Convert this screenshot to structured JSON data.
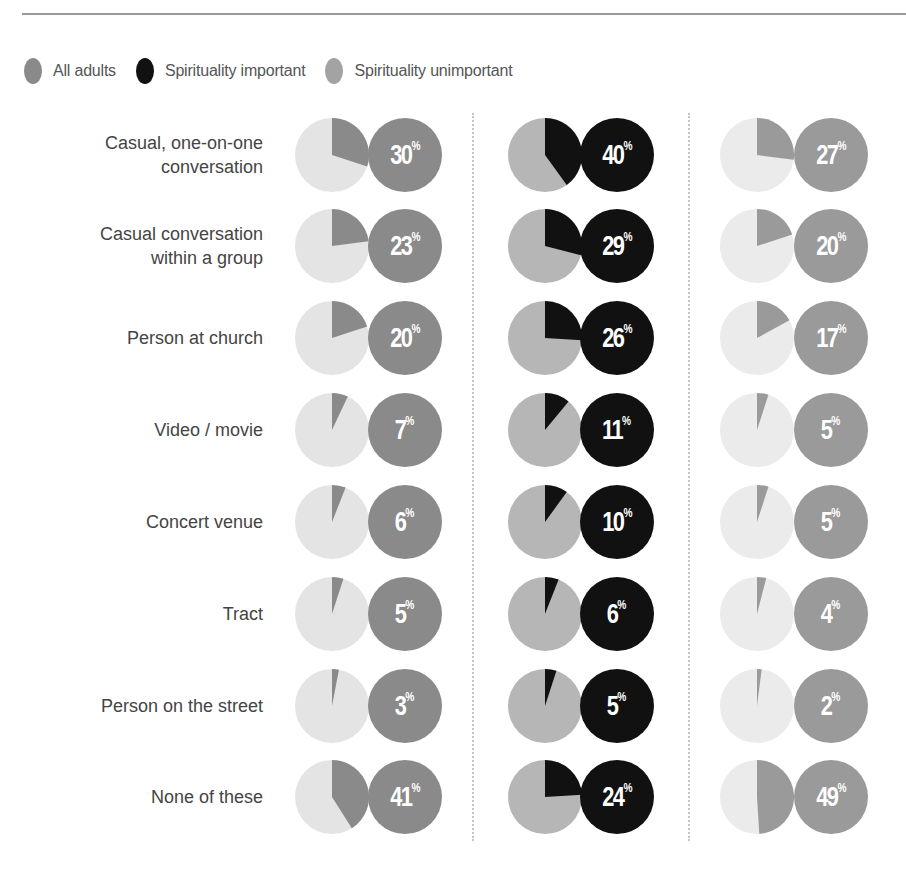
{
  "legend": [
    {
      "label": "All adults",
      "color": "#8a8a8a"
    },
    {
      "label": "Spirituality important",
      "color": "#111111"
    },
    {
      "label": "Spirituality unimportant",
      "color": "#a3a3a3"
    }
  ],
  "series_styles": [
    {
      "name": "All adults",
      "slice": "#8a8a8a",
      "rest": "#e4e4e4",
      "badge": "#8a8a8a"
    },
    {
      "name": "Spirituality important",
      "slice": "#111111",
      "rest": "#b6b6b6",
      "badge": "#111111"
    },
    {
      "name": "Spirituality unimportant",
      "slice": "#9a9a9a",
      "rest": "#ebebeb",
      "badge": "#9a9a9a"
    }
  ],
  "rows": [
    {
      "label": "Casual, one-on-one\nconversation",
      "values": [
        "30",
        "40",
        "27"
      ]
    },
    {
      "label": "Casual conversation\nwithin a group",
      "values": [
        "23",
        "29",
        "20"
      ]
    },
    {
      "label": "Person at church",
      "values": [
        "20",
        "26",
        "17"
      ]
    },
    {
      "label": "Video / movie",
      "values": [
        "7",
        "11",
        "5"
      ]
    },
    {
      "label": "Concert venue",
      "values": [
        "6",
        "10",
        "5"
      ]
    },
    {
      "label": "Tract",
      "values": [
        "5",
        "6",
        "4"
      ]
    },
    {
      "label": "Person on the street",
      "values": [
        "3",
        "5",
        "2"
      ]
    },
    {
      "label": "None of these",
      "values": [
        "41",
        "24",
        "49"
      ]
    }
  ],
  "pct_symbol": "%",
  "chart_data": {
    "type": "pie",
    "title": "",
    "categories": [
      "Casual, one-on-one conversation",
      "Casual conversation within a group",
      "Person at church",
      "Video / movie",
      "Concert venue",
      "Tract",
      "Person on the street",
      "None of these"
    ],
    "series": [
      {
        "name": "All adults",
        "values": [
          30,
          23,
          20,
          7,
          6,
          5,
          3,
          41
        ]
      },
      {
        "name": "Spirituality important",
        "values": [
          40,
          29,
          26,
          11,
          10,
          6,
          5,
          24
        ]
      },
      {
        "name": "Spirituality unimportant",
        "values": [
          27,
          20,
          17,
          5,
          5,
          4,
          2,
          49
        ]
      }
    ],
    "unit": "%",
    "legend_position": "top-left",
    "grid": false
  }
}
